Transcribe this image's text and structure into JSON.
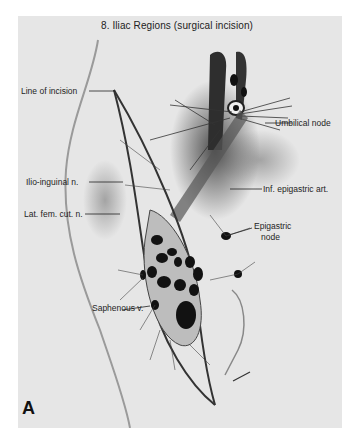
{
  "figure": {
    "title": "8. Iliac Regions (surgical incision)",
    "panel_letter": "A",
    "signature": "illustrator signature",
    "background_color": "#e6e6e6",
    "labels": [
      {
        "id": "line-of-incision",
        "text": "Line of incision",
        "side": "left"
      },
      {
        "id": "umbilical-node",
        "text": "Umbilical node",
        "side": "right"
      },
      {
        "id": "ilio-inguinal-n",
        "text": "Ilio-inguinal n.",
        "side": "left"
      },
      {
        "id": "inf-epigastric-art",
        "text": "Inf. epigastric art.",
        "side": "right"
      },
      {
        "id": "lat-fem-cut-n",
        "text": "Lat. fem. cut. n.",
        "side": "left"
      },
      {
        "id": "epigastric-node-line1",
        "text": "Epigastric",
        "side": "right"
      },
      {
        "id": "epigastric-node-line2",
        "text": "node",
        "side": "right"
      },
      {
        "id": "saphenous-v",
        "text": "Saphenous v.",
        "side": "left"
      }
    ]
  }
}
